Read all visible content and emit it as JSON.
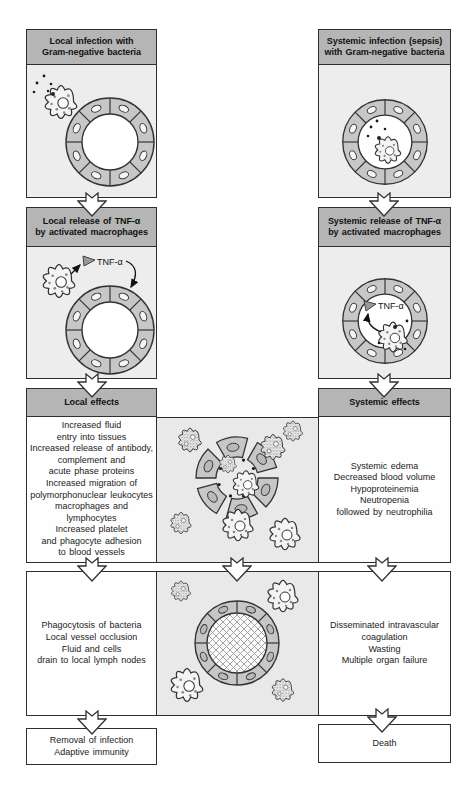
{
  "figure": {
    "palette": {
      "header_bg": "#b5b5b5",
      "panel_bg": "#ededed",
      "illustration_bg": "#e9e9e9",
      "white_box": "#fefefe",
      "vessel_wall": "#c7c7c7",
      "border": "#2e2e2e"
    },
    "tnf_label": "TNF-α",
    "left_column": {
      "infection_header": "Local infection with\nGram-negative bacteria",
      "release_header": "Local release of TNF-α\nby activated macrophages",
      "effects_header": "Local effects",
      "effects_body": "Increased fluid\nentry into tissues\nIncreased release of antibody,\ncomplement and\nacute phase proteins\nIncreased migration of\npolymorphonuclear leukocytes\nmacrophages and lymphocytes\nIncreased platelet\nand phagocyte adhesion\nto blood vessels",
      "outcome_body": "Phagocytosis of bacteria\nLocal vessel occlusion\nFluid and cells\ndrain to local lymph nodes",
      "final_box": "Removal of infection\nAdaptive immunity"
    },
    "right_column": {
      "infection_header": "Systemic infection (sepsis)\nwith Gram-negative bacteria",
      "release_header": "Systemic release of TNF-α\nby activated macrophages",
      "effects_header": "Systemic effects",
      "effects_body": "Systemic edema\nDecreased blood volume\nHypoproteinemia\nNeutropenia\nfollowed by neutrophilia",
      "outcome_body": "Disseminated intravascular\ncoagulation\nWasting\nMultiple organ failure",
      "final_box": "Death"
    }
  }
}
